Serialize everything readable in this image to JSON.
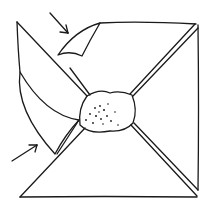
{
  "figure": {
    "stroke_color": "#1a1a1a",
    "background": "#ffffff",
    "arrows": [
      {
        "name": "top-arrow",
        "points_to": "upper curled flap"
      },
      {
        "name": "bottom-arrow",
        "points_to": "lower curled flap"
      }
    ]
  }
}
